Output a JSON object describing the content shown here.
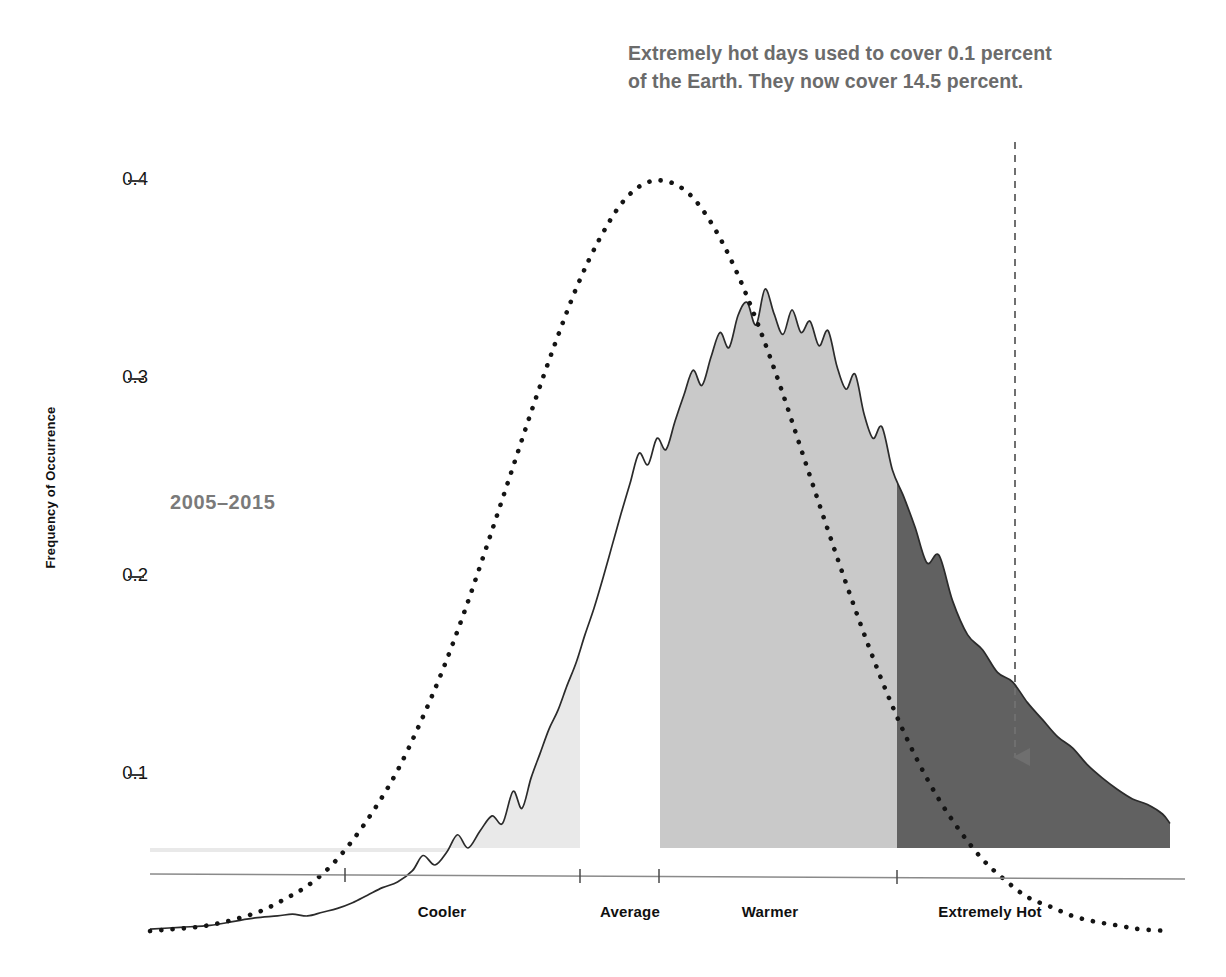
{
  "annotation": {
    "line1": "Extremely hot days used to cover 0.1 percent",
    "line2": "of the Earth. They now cover 14.5 percent.",
    "color": "#6b6b6b"
  },
  "series_label": "2005–2015",
  "axis": {
    "y_title": "Frequency of Occurrence",
    "y_ticks": [
      "0.4",
      "0.3",
      "0.2",
      "0.1"
    ],
    "x_categories": [
      "Cooler",
      "Average",
      "Warmer",
      "Extremely Hot"
    ]
  },
  "colors": {
    "cooler_fill": "#e9e9e9",
    "warmer_fill": "#c9c9c9",
    "extreme_fill": "#616161",
    "curve_stroke": "#2b2b2b",
    "dotted_curve": "#141414",
    "arrow": "#6f6f6f",
    "axis_line": "#8a8a8a"
  },
  "chart_data": {
    "type": "area",
    "title": "Extremely hot days used to cover 0.1 percent of the Earth. They now cover 14.5 percent.",
    "xlabel": "",
    "ylabel": "Frequency of Occurrence",
    "ylim": [
      0.045,
      0.425
    ],
    "y_ticks": [
      0.1,
      0.2,
      0.3,
      0.4
    ],
    "grid": false,
    "legend": "none",
    "x_categories": [
      "Cooler",
      "Average",
      "Warmer",
      "Extremely Hot"
    ],
    "x_category_boundaries_sigma": [
      -3.0,
      -1.0,
      -0.43,
      1.0,
      3.4
    ],
    "annotations": [
      {
        "text": "Extremely hot days used to cover 0.1 percent of the Earth. They now cover 14.5 percent.",
        "arrow": "down",
        "arrow_x_sigma": 2.0
      }
    ],
    "series": [
      {
        "name": "Reference normal distribution (baseline period)",
        "style": "dotted",
        "x": [
          -3.4,
          -3.25,
          -3.1,
          -2.95,
          -2.8,
          -2.65,
          -2.5,
          -2.35,
          -2.2,
          -2.05,
          -1.9,
          -1.75,
          -1.6,
          -1.45,
          -1.3,
          -1.15,
          -1.0,
          -0.85,
          -0.7,
          -0.55,
          -0.4,
          -0.25,
          -0.1,
          0.05,
          0.2,
          0.35,
          0.5,
          0.65,
          0.8,
          0.95,
          1.1,
          1.25,
          1.4,
          1.55,
          1.7,
          1.85,
          2.0,
          2.15,
          2.3,
          2.45,
          2.6,
          2.75,
          2.9,
          3.05,
          3.2,
          3.4
        ],
        "values": [
          0.001,
          0.002,
          0.003,
          0.005,
          0.008,
          0.012,
          0.018,
          0.025,
          0.035,
          0.049,
          0.066,
          0.086,
          0.111,
          0.139,
          0.171,
          0.206,
          0.242,
          0.278,
          0.312,
          0.343,
          0.368,
          0.387,
          0.397,
          0.398,
          0.391,
          0.375,
          0.352,
          0.323,
          0.29,
          0.254,
          0.218,
          0.183,
          0.15,
          0.12,
          0.094,
          0.072,
          0.054,
          0.039,
          0.028,
          0.019,
          0.014,
          0.009,
          0.006,
          0.004,
          0.002,
          0.001
        ]
      },
      {
        "name": "2005–2015 observed distribution",
        "style": "solid-filled",
        "x": [
          -3.4,
          -3.2,
          -3.0,
          -2.85,
          -2.7,
          -2.55,
          -2.45,
          -2.35,
          -2.25,
          -2.15,
          -2.05,
          -1.95,
          -1.85,
          -1.75,
          -1.65,
          -1.58,
          -1.5,
          -1.42,
          -1.35,
          -1.28,
          -1.2,
          -1.12,
          -1.05,
          -0.98,
          -0.92,
          -0.86,
          -0.8,
          -0.74,
          -0.68,
          -0.62,
          -0.56,
          -0.5,
          -0.44,
          -0.38,
          -0.32,
          -0.26,
          -0.2,
          -0.14,
          -0.08,
          -0.02,
          0.04,
          0.1,
          0.16,
          0.22,
          0.28,
          0.34,
          0.4,
          0.46,
          0.52,
          0.58,
          0.64,
          0.7,
          0.76,
          0.82,
          0.88,
          0.94,
          1.0,
          1.06,
          1.12,
          1.18,
          1.24,
          1.3,
          1.36,
          1.42,
          1.48,
          1.55,
          1.62,
          1.7,
          1.78,
          1.86,
          1.95,
          2.05,
          2.15,
          2.25,
          2.35,
          2.45,
          2.55,
          2.65,
          2.75,
          2.85,
          2.95,
          3.05,
          3.15,
          3.25,
          3.35,
          3.4
        ],
        "values": [
          0.002,
          0.003,
          0.004,
          0.006,
          0.008,
          0.009,
          0.01,
          0.009,
          0.011,
          0.013,
          0.016,
          0.02,
          0.024,
          0.027,
          0.033,
          0.041,
          0.036,
          0.043,
          0.052,
          0.045,
          0.054,
          0.062,
          0.058,
          0.075,
          0.066,
          0.082,
          0.095,
          0.108,
          0.118,
          0.131,
          0.143,
          0.158,
          0.172,
          0.188,
          0.205,
          0.222,
          0.238,
          0.254,
          0.248,
          0.262,
          0.256,
          0.271,
          0.285,
          0.298,
          0.29,
          0.305,
          0.318,
          0.31,
          0.327,
          0.334,
          0.322,
          0.341,
          0.328,
          0.317,
          0.33,
          0.318,
          0.324,
          0.311,
          0.319,
          0.3,
          0.288,
          0.296,
          0.275,
          0.262,
          0.268,
          0.245,
          0.232,
          0.215,
          0.196,
          0.2,
          0.176,
          0.158,
          0.15,
          0.138,
          0.133,
          0.122,
          0.113,
          0.104,
          0.098,
          0.089,
          0.082,
          0.076,
          0.071,
          0.068,
          0.063,
          0.058
        ]
      }
    ]
  }
}
